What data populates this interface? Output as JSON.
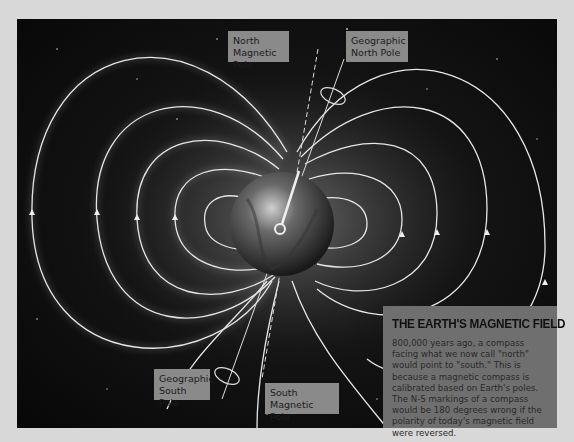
{
  "diagram": {
    "title": "THE EARTH'S MAGNETIC FIELD",
    "description": "800,000 years ago, a compass facing what we now call \"north\" would point to \"south.\" This is because a magnetic compass is calibrated based on Earth's poles. The N-S markings of a compass would be 180 degrees wrong if the polarity of today's magnetic field were reversed.",
    "labels": {
      "north_magnetic_pole": "North\nMagnetic Pole",
      "geographic_north_pole": "Geographic\nNorth Pole",
      "geographic_south_pole": "Geographic\nSouth Pole",
      "south_magnetic_pole": "South\nMagnetic Pole"
    },
    "icons": {
      "earth": "earth-globe-icon",
      "compass_needle": "compass-needle-icon",
      "rotation_ring": "rotation-ellipse-icon"
    },
    "colors": {
      "background": "#d8d8d8",
      "space": "#0a0a0a",
      "field_lines": "#e6e6e6",
      "label_box": "#8a8a8a",
      "info_box": "#6f6f6f"
    }
  }
}
